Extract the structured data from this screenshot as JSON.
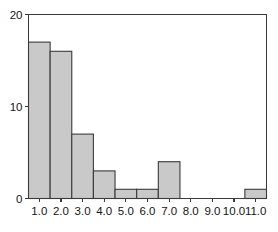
{
  "chart_data": {
    "type": "bar",
    "title": "",
    "subtitle": "",
    "xlabel": "",
    "ylabel": "",
    "grid": false,
    "legend": false,
    "legend_position": "none",
    "bin_width": 1.0,
    "bin_edges": [
      1.0,
      2.0,
      3.0,
      4.0,
      5.0,
      6.0,
      7.0,
      8.0,
      9.0,
      10.0,
      11.0,
      12.0
    ],
    "categories": [
      "1.0",
      "2.0",
      "3.0",
      "4.0",
      "5.0",
      "6.0",
      "7.0",
      "8.0",
      "9.0",
      "10.0",
      "11.0"
    ],
    "values": [
      17,
      16,
      7,
      3,
      1,
      1,
      4,
      0,
      0,
      0,
      1
    ],
    "x": [
      1.0,
      2.0,
      3.0,
      4.0,
      5.0,
      6.0,
      7.0,
      8.0,
      9.0,
      10.0,
      11.0
    ],
    "xlim": [
      0.5,
      11.5
    ],
    "ylim": [
      0,
      20
    ],
    "xticks": [
      1.0,
      2.0,
      3.0,
      4.0,
      5.0,
      6.0,
      7.0,
      8.0,
      9.0,
      10.0,
      11.0
    ],
    "xticklabels": [
      "1.0",
      "2.0",
      "3.0",
      "4.0",
      "5.0",
      "6.0",
      "7.0",
      "8.0",
      "9.0",
      "10.0",
      "11.0"
    ],
    "yticks": [
      0,
      10,
      20
    ],
    "yticklabels": [
      "0",
      "10",
      "20"
    ],
    "colors": {
      "bar_fill": "#c9c9c9",
      "bar_edge": "#3b3b3b",
      "axis": "#3b3b3b",
      "text": "#151515",
      "background": "#ffffff"
    }
  }
}
